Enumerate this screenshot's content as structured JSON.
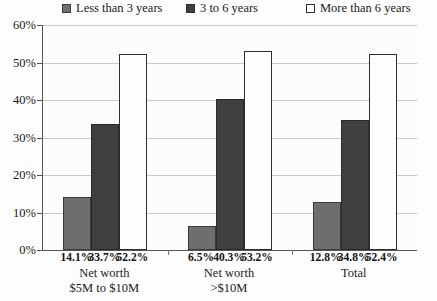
{
  "chart_data": {
    "type": "bar",
    "title": "",
    "xlabel": "",
    "ylabel": "",
    "ylim": [
      0,
      60
    ],
    "ytick_values": [
      0,
      10,
      20,
      30,
      40,
      50,
      60
    ],
    "ytick_labels": [
      "0%",
      "10%",
      "20%",
      "30%",
      "40%",
      "50%",
      "60%"
    ],
    "grid": true,
    "legend_position": "top",
    "categories": [
      "Net worth\n$5M to $10M",
      "Net worth\n>$10M",
      "Total"
    ],
    "category_lines": [
      [
        "Net worth",
        "$5M to $10M"
      ],
      [
        "Net worth",
        ">$10M"
      ],
      [
        "Total"
      ]
    ],
    "series": [
      {
        "name": "Less than 3 years",
        "values": [
          14.1,
          6.5,
          12.8
        ],
        "value_labels": [
          "14.1%",
          "6.5%",
          "12.8%"
        ],
        "color": "#6e6e6e",
        "border": "#3a3a3a"
      },
      {
        "name": "3 to 6 years",
        "values": [
          33.7,
          40.3,
          34.8
        ],
        "value_labels": [
          "33.7%",
          "40.3%",
          "34.8%"
        ],
        "color": "#3f3f3f",
        "border": "#2a2a2a"
      },
      {
        "name": "More than 6 years",
        "values": [
          52.2,
          53.2,
          52.4
        ],
        "value_labels": [
          "52.2%",
          "53.2%",
          "52.4%"
        ],
        "color": "#fdfdfd",
        "border": "#2e2e2e"
      }
    ]
  },
  "legend": {
    "items": [
      {
        "label": "Less than 3 years",
        "color": "#6e6e6e",
        "border": "#3a3a3a"
      },
      {
        "label": "3 to 6 years",
        "color": "#3f3f3f",
        "border": "#2a2a2a"
      },
      {
        "label": "More than 6 years",
        "color": "#ffffff",
        "border": "#2e2e2e"
      }
    ]
  },
  "axis": {
    "y_labels": [
      "60%",
      "50%",
      "40%",
      "30%",
      "20%",
      "10%",
      "0%"
    ]
  },
  "colors": {
    "background": "#fdfdfd",
    "plot_background": "#fcfcfc",
    "gridline": "#c9c9c9",
    "axis": "#555555",
    "text": "#1a1a1a"
  }
}
